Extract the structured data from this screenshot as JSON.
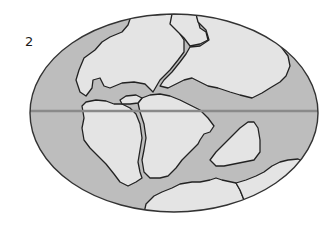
{
  "figure": {
    "panel_label": "2",
    "colors": {
      "ocean": "#bdbdbd",
      "land": "#e4e4e4",
      "outline": "#222222",
      "equator": "#8a8a8a",
      "background": "#ffffff"
    },
    "globe": {
      "cx": 174,
      "cy": 113,
      "rx": 144,
      "ry": 99
    },
    "equator_y": 111,
    "landmasses": [
      {
        "name": "north-america-landmass"
      },
      {
        "name": "greenland-landmass"
      },
      {
        "name": "eurasia-landmass"
      },
      {
        "name": "north-africa-landmass"
      },
      {
        "name": "south-america-landmass"
      },
      {
        "name": "africa-landmass"
      },
      {
        "name": "india-landmass"
      },
      {
        "name": "antarctica-landmass"
      },
      {
        "name": "australia-landmass"
      },
      {
        "name": "central-america-fragment"
      }
    ]
  }
}
